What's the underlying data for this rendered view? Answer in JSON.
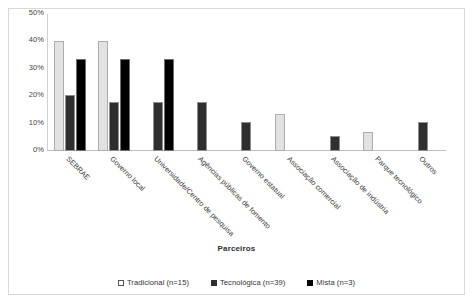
{
  "chart_data": {
    "type": "bar",
    "title": "",
    "subtitle": "",
    "xlabel": "Parceiros",
    "ylabel": "",
    "ylim": [
      0,
      50
    ],
    "yticks": [
      0,
      10,
      20,
      30,
      40,
      50
    ],
    "ytick_labels": [
      "0%",
      "10%",
      "20%",
      "30%",
      "40%",
      "50%"
    ],
    "grid": false,
    "legend_position": "bottom",
    "value_unit": "percent",
    "categories": [
      "SEBRAE",
      "Governo local",
      "Universidade/Centro de pesquisa",
      "Agências públicas de fomento",
      "Governo estatual",
      "Associação comercial",
      "Associação de indústria",
      "Parque tecnológico",
      "Outros"
    ],
    "series": [
      {
        "name": "Tradicional (n=15)",
        "color": "#e2e2e2",
        "values": [
          40,
          40,
          0,
          0,
          0,
          13.5,
          0,
          7,
          0
        ]
      },
      {
        "name": "Tecnológica (n=39)",
        "color": "#2f2f2f",
        "values": [
          20.5,
          18,
          18,
          18,
          10.5,
          0,
          5.5,
          0,
          10.5
        ]
      },
      {
        "name": "Mista (n=3)",
        "color": "#000000",
        "values": [
          33.5,
          33.5,
          33.5,
          0,
          0,
          0,
          0,
          0,
          0
        ]
      }
    ]
  },
  "legend": {
    "items": [
      {
        "label": "Tradicional (n=15)",
        "swatch": "open-square-marker"
      },
      {
        "label": "Tecnológica (n=39)",
        "swatch": "filled-square-marker"
      },
      {
        "label": "Mista (n=3)",
        "swatch": "filled-square-marker"
      }
    ]
  },
  "axis": {
    "x_title": "Parceiros"
  }
}
